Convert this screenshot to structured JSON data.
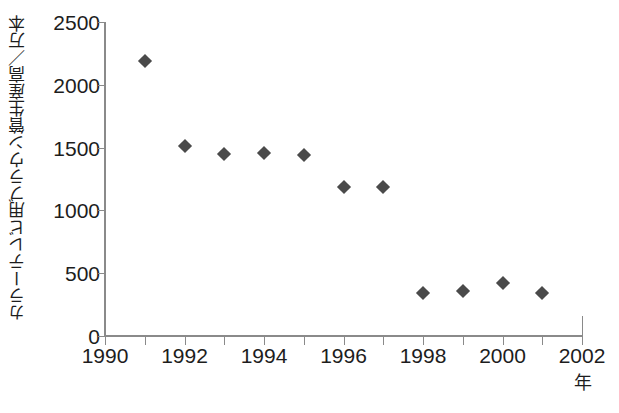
{
  "chart_data": {
    "type": "scatter",
    "title": "",
    "xlabel": "年",
    "ylabel": "カラーテレビ用ブラウン管生産高／万本",
    "x": [
      1991,
      1992,
      1993,
      1994,
      1995,
      1996,
      1997,
      1998,
      1999,
      2000,
      2001
    ],
    "values": [
      2190,
      1510,
      1450,
      1455,
      1445,
      1185,
      1190,
      345,
      355,
      425,
      340
    ],
    "series": [
      {
        "name": "カラーテレビ用ブラウン管生産高",
        "values": [
          2190,
          1510,
          1450,
          1455,
          1445,
          1185,
          1190,
          345,
          355,
          425,
          340
        ]
      }
    ],
    "xlim": [
      1990,
      2002
    ],
    "ylim": [
      0,
      2500
    ],
    "x_ticks": [
      1990,
      1992,
      1994,
      1996,
      1998,
      2000,
      2002
    ],
    "x_tick_labels": [
      "1990",
      "1992",
      "1994",
      "1996",
      "1998",
      "2000",
      "2002"
    ],
    "x_minor_ticks": [
      1991,
      1993,
      1995,
      1997,
      1999,
      2001
    ],
    "y_ticks": [
      0,
      500,
      1000,
      1500,
      2000,
      2500
    ],
    "y_tick_labels": [
      "0",
      "500",
      "1000",
      "1500",
      "2000",
      "2500"
    ],
    "grid": false,
    "legend": false,
    "marker_shape": "diamond",
    "marker_color": "#4a4a4a",
    "axis_color": "#8a8a8a",
    "text_color": "#1d1d1d",
    "background_color": "#ffffff"
  },
  "axes": {
    "y_title": "カラーテレビ用ブラウン管生産高／万本",
    "x_unit": "年"
  }
}
